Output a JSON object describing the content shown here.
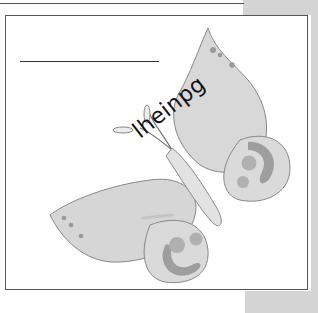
{
  "worksheet": {
    "word": "lheinpg",
    "writing_line": "",
    "illustration": "butterfly",
    "colors": {
      "wing_fill": "#d6d6d6",
      "spot_dark": "#9a9a9a",
      "spot_mid": "#b0b0b0",
      "frame": "#555555",
      "page_edge": "#d4d4d4"
    }
  }
}
